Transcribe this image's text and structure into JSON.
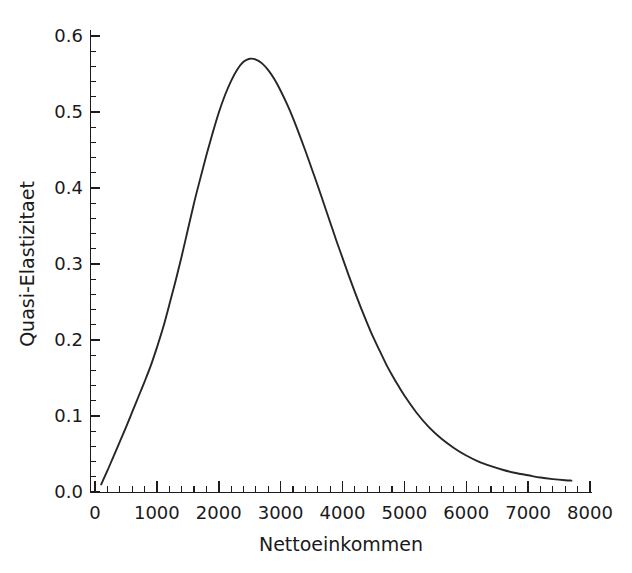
{
  "chart_data": {
    "type": "line",
    "title": "",
    "xlabel": "Nettoeinkommen",
    "ylabel": "Quasi-Elastizitaet",
    "xlim": [
      0,
      8000
    ],
    "ylim": [
      0.0,
      0.6
    ],
    "grid": false,
    "legend": null,
    "x_ticks": [
      0,
      1000,
      2000,
      3000,
      4000,
      5000,
      6000,
      7000,
      8000
    ],
    "x_tick_labels": [
      "0",
      "1000",
      "2000",
      "3000",
      "4000",
      "5000",
      "6000",
      "7000",
      "8000"
    ],
    "x_minor_tick_step": 200,
    "y_ticks": [
      0.0,
      0.1,
      0.2,
      0.3,
      0.4,
      0.5,
      0.6
    ],
    "y_tick_labels": [
      "0.0",
      "0.1",
      "0.2",
      "0.3",
      "0.4",
      "0.5",
      "0.6"
    ],
    "y_minor_tick_step": 0.02,
    "series": [
      {
        "name": "Quasi-Elastizitaet",
        "color": "#262626",
        "x": [
          100,
          200,
          300,
          400,
          500,
          600,
          700,
          800,
          900,
          1000,
          1100,
          1200,
          1300,
          1400,
          1500,
          1600,
          1700,
          1800,
          1900,
          2000,
          2100,
          2200,
          2300,
          2400,
          2500,
          2600,
          2700,
          2800,
          2900,
          3000,
          3100,
          3200,
          3300,
          3400,
          3500,
          3600,
          3700,
          3800,
          3900,
          4000,
          4100,
          4200,
          4300,
          4400,
          4500,
          4600,
          4700,
          4800,
          4900,
          5000,
          5200,
          5400,
          5600,
          5800,
          6000,
          6200,
          6400,
          6600,
          6800,
          7000,
          7200,
          7400,
          7600,
          7700
        ],
        "y": [
          0.01,
          0.028,
          0.047,
          0.066,
          0.085,
          0.105,
          0.125,
          0.145,
          0.166,
          0.19,
          0.216,
          0.246,
          0.277,
          0.31,
          0.345,
          0.38,
          0.412,
          0.443,
          0.472,
          0.499,
          0.522,
          0.541,
          0.556,
          0.566,
          0.57,
          0.569,
          0.564,
          0.555,
          0.543,
          0.528,
          0.511,
          0.492,
          0.471,
          0.449,
          0.426,
          0.403,
          0.379,
          0.355,
          0.331,
          0.308,
          0.285,
          0.263,
          0.242,
          0.222,
          0.203,
          0.186,
          0.169,
          0.154,
          0.14,
          0.127,
          0.104,
          0.085,
          0.07,
          0.058,
          0.048,
          0.04,
          0.034,
          0.029,
          0.025,
          0.022,
          0.019,
          0.017,
          0.0155,
          0.015
        ]
      }
    ],
    "peak": {
      "x": 2500,
      "y": 0.57
    }
  }
}
